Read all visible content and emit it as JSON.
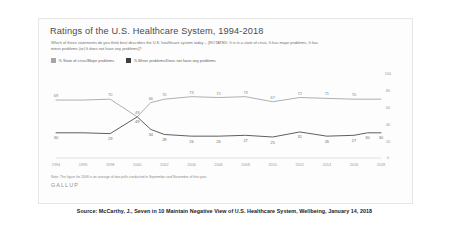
{
  "card": {
    "title": "Ratings of the U.S. Healthcare System, 1994-2018",
    "subtitle": "Which of these statements do you think best describes the U.S. healthcare system today -- [ROTATED: It is in a state of crisis, It has major problems, It has minor problems (or) It does not have any problems]?",
    "note": "Note: The figure for 2008 is an average of two polls conducted in September and November of that year",
    "logo": "GALLUP"
  },
  "caption": "Source: McCarthy, J., Seven in 10 Maintain Negative View of U.S. Healthcare System, Wellbeing, January 14, 2018",
  "colors": {
    "series_crisis": "#a6a6a6",
    "series_minor": "#4d4d4d",
    "axis": "#d2d2d2",
    "tick_label": "#9a9a9a",
    "title": "#4a4a4a"
  },
  "chart_data": {
    "type": "line",
    "title": "Ratings of the U.S. Healthcare System, 1994-2018",
    "xlabel": "",
    "ylabel": "",
    "ylim": [
      0,
      100
    ],
    "yticks": [
      0,
      20,
      40,
      60,
      80,
      100
    ],
    "grid": false,
    "legend_position": "top-left",
    "x": [
      1994,
      1996,
      1998,
      2000,
      2001,
      2002,
      2004,
      2006,
      2008,
      2010,
      2012,
      2014,
      2016,
      2017,
      2018
    ],
    "xticks": [
      1994,
      1996,
      1998,
      2000,
      2002,
      2004,
      2006,
      2008,
      2010,
      2012,
      2014,
      2016,
      2018
    ],
    "series": [
      {
        "name": "% State of crisis/Major problems",
        "color": "#a6a6a6",
        "values": [
          69,
          69,
          70,
          49,
          66,
          70,
          73,
          72,
          73,
          67,
          72,
          71,
          70,
          70,
          70
        ],
        "labels": [
          69,
          null,
          70,
          49,
          66,
          70,
          73,
          72,
          73,
          67,
          72,
          71,
          70,
          null,
          null
        ]
      },
      {
        "name": "% Minor problems/Does not have any problems",
        "color": "#4d4d4d",
        "values": [
          30,
          30,
          29,
          49,
          34,
          28,
          26,
          26,
          27,
          25,
          31,
          26,
          27,
          30,
          30
        ],
        "labels": [
          30,
          null,
          29,
          49,
          34,
          28,
          26,
          26,
          27,
          25,
          31,
          26,
          27,
          30,
          30
        ]
      }
    ]
  }
}
